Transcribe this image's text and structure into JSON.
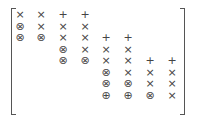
{
  "matrix": {
    "description": "Staircase (block-banded) matrix pattern",
    "symbols": {
      "x": "×",
      "plus": "+",
      "otimes": "⊗",
      "oplus": "⊕"
    },
    "rows": [
      [
        "×",
        "×",
        "+",
        "+",
        "",
        "",
        "",
        ""
      ],
      [
        "⊗",
        "×",
        "×",
        "×",
        "",
        "",
        "",
        ""
      ],
      [
        "⊗",
        "⊗",
        "×",
        "×",
        "+",
        "+",
        "",
        ""
      ],
      [
        "",
        "",
        "⊗",
        "×",
        "×",
        "×",
        "",
        ""
      ],
      [
        "",
        "",
        "⊗",
        "⊗",
        "×",
        "×",
        "+",
        "+"
      ],
      [
        "",
        "",
        "",
        "",
        "⊗",
        "×",
        "×",
        "×"
      ],
      [
        "",
        "",
        "",
        "",
        "⊗",
        "⊗",
        "×",
        "×"
      ],
      [
        "",
        "",
        "",
        "",
        "⊕",
        "⊕",
        "⊗",
        "×"
      ]
    ]
  }
}
